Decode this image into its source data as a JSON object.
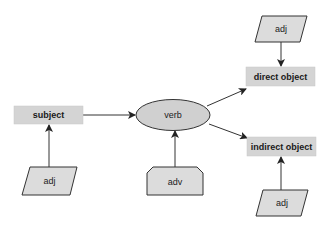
{
  "diagram": {
    "type": "sentence-structure",
    "colors": {
      "box_fill": "#d4d4d4",
      "shape_fill": "#dcdcdc",
      "stroke": "#333333",
      "arrow": "#222222",
      "background": "#ffffff"
    },
    "nodes": {
      "subject": {
        "label": "subject",
        "shape": "rectangle"
      },
      "verb": {
        "label": "verb",
        "shape": "ellipse"
      },
      "direct_object": {
        "label": "direct object",
        "shape": "rectangle"
      },
      "indirect_object": {
        "label": "indirect object",
        "shape": "rectangle"
      },
      "adj_subject": {
        "label": "adj",
        "shape": "parallelogram"
      },
      "adv_verb": {
        "label": "adv",
        "shape": "chamfered-rectangle"
      },
      "adj_direct": {
        "label": "adj",
        "shape": "parallelogram"
      },
      "adj_indirect": {
        "label": "adj",
        "shape": "parallelogram"
      }
    },
    "edges": [
      {
        "from": "subject",
        "to": "verb"
      },
      {
        "from": "verb",
        "to": "direct_object"
      },
      {
        "from": "verb",
        "to": "indirect_object"
      },
      {
        "from": "adj_subject",
        "to": "subject"
      },
      {
        "from": "adv_verb",
        "to": "verb"
      },
      {
        "from": "adj_direct",
        "to": "direct_object"
      },
      {
        "from": "adj_indirect",
        "to": "indirect_object"
      }
    ]
  }
}
